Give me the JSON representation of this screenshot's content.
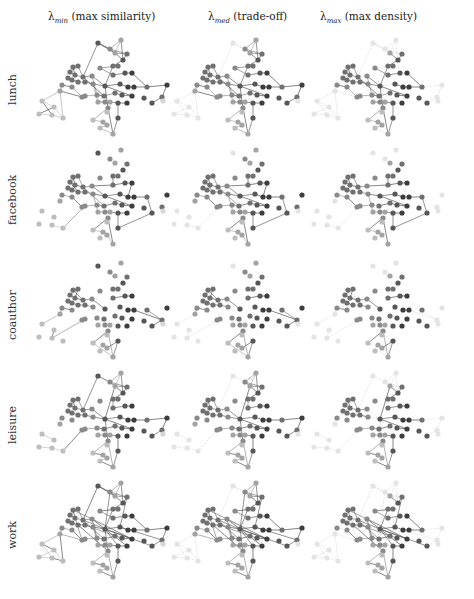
{
  "figure": {
    "columns": [
      {
        "symbol": "λ",
        "sub": "min",
        "label": "(max similarity)"
      },
      {
        "symbol": "λ",
        "sub": "med",
        "label": "(trade-off)"
      },
      {
        "symbol": "λ",
        "sub": "max",
        "label": "(max density)"
      }
    ],
    "rows": [
      "lunch",
      "facebook",
      "coauthor",
      "leisure",
      "work"
    ]
  },
  "layout": {
    "col_x": [
      35,
      170,
      310
    ],
    "row_y": [
      35,
      145,
      258,
      368,
      478
    ],
    "title_x": [
      48,
      208,
      320
    ],
    "label_y": [
      55,
      165,
      280,
      390,
      500
    ],
    "label_h": [
      70,
      70,
      70,
      70,
      70
    ]
  },
  "colors": {
    "node_shades": [
      "#d6d6d6",
      "#bdbdbd",
      "#a3a3a3",
      "#8a8a8a",
      "#707070",
      "#575757",
      "#3d3d3d"
    ],
    "edge_strong": "#444444",
    "edge_faded": "#cfcfcf"
  },
  "nodes": [
    [
      63,
      8,
      5
    ],
    [
      86,
      5,
      2
    ],
    [
      75,
      14,
      3
    ],
    [
      80,
      18,
      2
    ],
    [
      92,
      19,
      4
    ],
    [
      88,
      25,
      5
    ],
    [
      78,
      31,
      4
    ],
    [
      83,
      31,
      4
    ],
    [
      65,
      33,
      3
    ],
    [
      38,
      32,
      4
    ],
    [
      43,
      31,
      4
    ],
    [
      35,
      37,
      4
    ],
    [
      40,
      40,
      4
    ],
    [
      48,
      42,
      4
    ],
    [
      57,
      41,
      3
    ],
    [
      33,
      43,
      4
    ],
    [
      37,
      45,
      4
    ],
    [
      43,
      47,
      4
    ],
    [
      50,
      47,
      4
    ],
    [
      58,
      49,
      3
    ],
    [
      27,
      50,
      3
    ],
    [
      37,
      52,
      3
    ],
    [
      70,
      51,
      5
    ],
    [
      85,
      49,
      5
    ],
    [
      78,
      40,
      4
    ],
    [
      90,
      38,
      5
    ],
    [
      97,
      38,
      6
    ],
    [
      93,
      52,
      6
    ],
    [
      99,
      52,
      6
    ],
    [
      112,
      52,
      4
    ],
    [
      132,
      50,
      6
    ],
    [
      127,
      62,
      4
    ],
    [
      117,
      68,
      5
    ],
    [
      109,
      63,
      5
    ],
    [
      97,
      61,
      6
    ],
    [
      87,
      60,
      5
    ],
    [
      80,
      58,
      4
    ],
    [
      69,
      61,
      4
    ],
    [
      62,
      60,
      3
    ],
    [
      50,
      61,
      3
    ],
    [
      47,
      62,
      3
    ],
    [
      25,
      56,
      2
    ],
    [
      7,
      66,
      1
    ],
    [
      19,
      72,
      1
    ],
    [
      4,
      79,
      1
    ],
    [
      17,
      80,
      1
    ],
    [
      28,
      83,
      1
    ],
    [
      63,
      67,
      2
    ],
    [
      70,
      67,
      3
    ],
    [
      75,
      67,
      2
    ],
    [
      83,
      68,
      5
    ],
    [
      92,
      68,
      6
    ],
    [
      73,
      73,
      3
    ],
    [
      58,
      85,
      1
    ],
    [
      68,
      87,
      2
    ],
    [
      72,
      90,
      2
    ],
    [
      65,
      93,
      1
    ],
    [
      78,
      99,
      2
    ],
    [
      83,
      83,
      5
    ],
    [
      72,
      77,
      1
    ],
    [
      128,
      66,
      0
    ]
  ],
  "edge_sets": {
    "lunch": [
      [
        0,
        2
      ],
      [
        1,
        2
      ],
      [
        1,
        3
      ],
      [
        2,
        3
      ],
      [
        2,
        4
      ],
      [
        3,
        4
      ],
      [
        3,
        5
      ],
      [
        4,
        5
      ],
      [
        5,
        6
      ],
      [
        6,
        7
      ],
      [
        7,
        8
      ],
      [
        1,
        5
      ],
      [
        0,
        3
      ],
      [
        8,
        24
      ],
      [
        24,
        25
      ],
      [
        25,
        26
      ],
      [
        9,
        10
      ],
      [
        10,
        11
      ],
      [
        11,
        12
      ],
      [
        12,
        13
      ],
      [
        13,
        14
      ],
      [
        9,
        12
      ],
      [
        10,
        13
      ],
      [
        14,
        22
      ],
      [
        15,
        16
      ],
      [
        16,
        17
      ],
      [
        17,
        18
      ],
      [
        18,
        19
      ],
      [
        15,
        17
      ],
      [
        19,
        22
      ],
      [
        22,
        23
      ],
      [
        23,
        27
      ],
      [
        27,
        28
      ],
      [
        28,
        29
      ],
      [
        29,
        30
      ],
      [
        30,
        31
      ],
      [
        31,
        32
      ],
      [
        26,
        29
      ],
      [
        22,
        34
      ],
      [
        34,
        35
      ],
      [
        35,
        36
      ],
      [
        36,
        37
      ],
      [
        37,
        38
      ],
      [
        38,
        39
      ],
      [
        39,
        40
      ],
      [
        40,
        41
      ],
      [
        41,
        42
      ],
      [
        42,
        43
      ],
      [
        43,
        44
      ],
      [
        44,
        45
      ],
      [
        45,
        46
      ],
      [
        42,
        45
      ],
      [
        43,
        46
      ],
      [
        41,
        46
      ],
      [
        20,
        21
      ],
      [
        20,
        41
      ],
      [
        21,
        40
      ],
      [
        47,
        48
      ],
      [
        48,
        49
      ],
      [
        49,
        50
      ],
      [
        50,
        51
      ],
      [
        52,
        53
      ],
      [
        53,
        54
      ],
      [
        54,
        55
      ],
      [
        55,
        56
      ],
      [
        56,
        57
      ],
      [
        52,
        57
      ],
      [
        58,
        57
      ],
      [
        50,
        58
      ],
      [
        22,
        52
      ],
      [
        19,
        47
      ],
      [
        14,
        38
      ],
      [
        13,
        37
      ],
      [
        6,
        22
      ],
      [
        0,
        13
      ]
    ],
    "facebook": [
      [
        9,
        10
      ],
      [
        10,
        11
      ],
      [
        11,
        12
      ],
      [
        12,
        13
      ],
      [
        13,
        14
      ],
      [
        14,
        22
      ],
      [
        9,
        12
      ],
      [
        10,
        13
      ],
      [
        15,
        16
      ],
      [
        16,
        17
      ],
      [
        17,
        18
      ],
      [
        18,
        19
      ],
      [
        19,
        22
      ],
      [
        22,
        23
      ],
      [
        23,
        27
      ],
      [
        27,
        28
      ],
      [
        28,
        29
      ],
      [
        29,
        32
      ],
      [
        24,
        25
      ],
      [
        25,
        26
      ],
      [
        26,
        27
      ],
      [
        22,
        34
      ],
      [
        34,
        35
      ],
      [
        35,
        36
      ],
      [
        36,
        37
      ],
      [
        37,
        38
      ],
      [
        38,
        39
      ],
      [
        21,
        40
      ],
      [
        20,
        21
      ],
      [
        47,
        48
      ],
      [
        48,
        49
      ],
      [
        49,
        50
      ],
      [
        50,
        51
      ],
      [
        52,
        53
      ],
      [
        53,
        54
      ],
      [
        55,
        57
      ],
      [
        52,
        57
      ],
      [
        50,
        58
      ],
      [
        58,
        32
      ],
      [
        14,
        24
      ],
      [
        13,
        37
      ],
      [
        19,
        47
      ],
      [
        6,
        24
      ],
      [
        45,
        46
      ],
      [
        46,
        39
      ],
      [
        11,
        17
      ]
    ],
    "coauthor": [
      [
        9,
        10
      ],
      [
        10,
        11
      ],
      [
        11,
        12
      ],
      [
        12,
        13
      ],
      [
        13,
        14
      ],
      [
        9,
        13
      ],
      [
        10,
        12
      ],
      [
        14,
        22
      ],
      [
        15,
        16
      ],
      [
        16,
        17
      ],
      [
        17,
        18
      ],
      [
        18,
        19
      ],
      [
        20,
        21
      ],
      [
        20,
        41
      ],
      [
        41,
        42
      ],
      [
        43,
        45
      ],
      [
        45,
        39
      ],
      [
        39,
        40
      ],
      [
        24,
        25
      ],
      [
        25,
        26
      ],
      [
        29,
        31
      ],
      [
        31,
        32
      ],
      [
        27,
        28
      ],
      [
        28,
        31
      ],
      [
        52,
        53
      ],
      [
        53,
        57
      ],
      [
        52,
        57
      ],
      [
        55,
        58
      ],
      [
        57,
        58
      ]
    ],
    "leisure": [
      [
        0,
        2
      ],
      [
        1,
        2
      ],
      [
        1,
        3
      ],
      [
        2,
        3
      ],
      [
        2,
        4
      ],
      [
        3,
        4
      ],
      [
        3,
        5
      ],
      [
        4,
        5
      ],
      [
        1,
        5
      ],
      [
        5,
        6
      ],
      [
        6,
        24
      ],
      [
        24,
        25
      ],
      [
        25,
        26
      ],
      [
        9,
        10
      ],
      [
        10,
        11
      ],
      [
        11,
        12
      ],
      [
        12,
        13
      ],
      [
        13,
        14
      ],
      [
        9,
        12
      ],
      [
        10,
        13
      ],
      [
        14,
        22
      ],
      [
        15,
        16
      ],
      [
        16,
        17
      ],
      [
        17,
        18
      ],
      [
        18,
        19
      ],
      [
        19,
        22
      ],
      [
        22,
        23
      ],
      [
        23,
        27
      ],
      [
        27,
        28
      ],
      [
        28,
        29
      ],
      [
        29,
        30
      ],
      [
        30,
        31
      ],
      [
        31,
        32
      ],
      [
        22,
        34
      ],
      [
        34,
        35
      ],
      [
        35,
        36
      ],
      [
        36,
        37
      ],
      [
        37,
        38
      ],
      [
        38,
        39
      ],
      [
        39,
        40
      ],
      [
        44,
        45
      ],
      [
        45,
        46
      ],
      [
        46,
        40
      ],
      [
        42,
        43
      ],
      [
        47,
        48
      ],
      [
        48,
        49
      ],
      [
        49,
        50
      ],
      [
        52,
        53
      ],
      [
        53,
        54
      ],
      [
        54,
        55
      ],
      [
        55,
        56
      ],
      [
        56,
        57
      ],
      [
        52,
        57
      ],
      [
        58,
        57
      ],
      [
        50,
        58
      ],
      [
        22,
        52
      ],
      [
        0,
        13
      ],
      [
        3,
        22
      ]
    ],
    "work": [
      [
        0,
        2
      ],
      [
        1,
        2
      ],
      [
        1,
        3
      ],
      [
        2,
        3
      ],
      [
        2,
        4
      ],
      [
        3,
        4
      ],
      [
        3,
        5
      ],
      [
        4,
        5
      ],
      [
        1,
        5
      ],
      [
        0,
        3
      ],
      [
        5,
        6
      ],
      [
        6,
        7
      ],
      [
        7,
        8
      ],
      [
        8,
        24
      ],
      [
        24,
        25
      ],
      [
        25,
        26
      ],
      [
        9,
        10
      ],
      [
        10,
        11
      ],
      [
        11,
        12
      ],
      [
        12,
        13
      ],
      [
        13,
        14
      ],
      [
        9,
        12
      ],
      [
        10,
        13
      ],
      [
        9,
        14
      ],
      [
        14,
        22
      ],
      [
        15,
        16
      ],
      [
        16,
        17
      ],
      [
        17,
        18
      ],
      [
        18,
        19
      ],
      [
        15,
        17
      ],
      [
        19,
        22
      ],
      [
        22,
        23
      ],
      [
        23,
        27
      ],
      [
        27,
        28
      ],
      [
        28,
        29
      ],
      [
        29,
        30
      ],
      [
        30,
        31
      ],
      [
        31,
        32
      ],
      [
        26,
        29
      ],
      [
        22,
        34
      ],
      [
        34,
        35
      ],
      [
        35,
        36
      ],
      [
        36,
        37
      ],
      [
        37,
        38
      ],
      [
        38,
        39
      ],
      [
        39,
        40
      ],
      [
        40,
        41
      ],
      [
        41,
        42
      ],
      [
        42,
        43
      ],
      [
        43,
        44
      ],
      [
        44,
        45
      ],
      [
        45,
        46
      ],
      [
        42,
        45
      ],
      [
        43,
        46
      ],
      [
        41,
        46
      ],
      [
        20,
        21
      ],
      [
        20,
        41
      ],
      [
        21,
        40
      ],
      [
        47,
        48
      ],
      [
        48,
        49
      ],
      [
        49,
        50
      ],
      [
        50,
        51
      ],
      [
        52,
        53
      ],
      [
        53,
        54
      ],
      [
        54,
        55
      ],
      [
        55,
        56
      ],
      [
        56,
        57
      ],
      [
        52,
        57
      ],
      [
        58,
        57
      ],
      [
        50,
        58
      ],
      [
        22,
        52
      ],
      [
        19,
        47
      ],
      [
        14,
        38
      ],
      [
        13,
        37
      ],
      [
        6,
        22
      ],
      [
        0,
        13
      ],
      [
        2,
        22
      ],
      [
        4,
        23
      ],
      [
        14,
        34
      ],
      [
        18,
        36
      ],
      [
        12,
        40
      ],
      [
        22,
        51
      ],
      [
        22,
        50
      ],
      [
        13,
        22
      ],
      [
        17,
        52
      ],
      [
        23,
        31
      ],
      [
        22,
        32
      ]
    ]
  },
  "faded_nodes": {
    "col1": [
      42,
      43,
      44,
      45,
      46,
      0,
      60
    ],
    "col2": [
      42,
      43,
      44,
      45,
      46,
      0,
      1,
      2,
      41,
      60,
      30,
      31
    ]
  }
}
